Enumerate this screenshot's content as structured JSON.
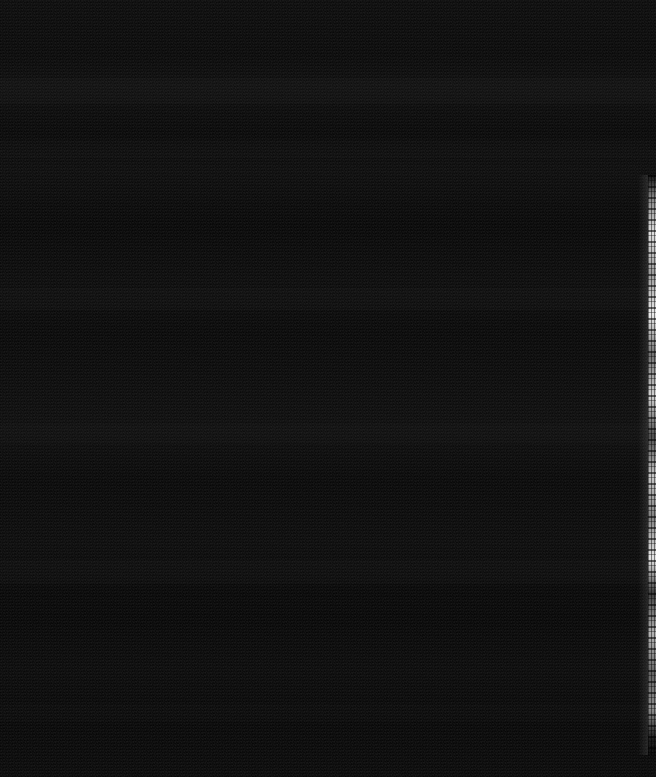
{
  "capture": {
    "title": "Black Screen Capture",
    "description": "Near-black screen capture; no legible UI text, icons or controls are rendered in the pixels.",
    "width_px": 656,
    "height_px": 777,
    "background_color": "#070707",
    "content_text": ""
  },
  "surface": {
    "name": "black-screen-surface",
    "label": "",
    "base_color": "#070707",
    "noise": "sensor-grain",
    "banding": "faint-horizontal"
  },
  "bands": [
    {
      "label": "",
      "top_px": 78,
      "height_px": 26
    },
    {
      "label": "",
      "top_px": 140,
      "height_px": 18
    },
    {
      "label": "",
      "top_px": 288,
      "height_px": 22
    },
    {
      "label": "",
      "top_px": 424,
      "height_px": 20
    },
    {
      "label": "",
      "top_px": 560,
      "height_px": 24
    },
    {
      "label": "",
      "top_px": 598,
      "height_px": 14
    },
    {
      "label": "",
      "top_px": 704,
      "height_px": 18
    }
  ],
  "edge_strip": {
    "name": "right-edge-light-strip",
    "label": "",
    "color": "#e8e8e8",
    "left_px": 648,
    "width_px": 8,
    "top_px": 175,
    "height_px": 580
  }
}
